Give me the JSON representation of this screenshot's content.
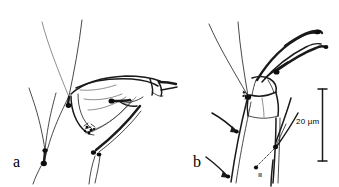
{
  "figure": {
    "type": "scientific-line-drawing",
    "background_color": "#ffffff",
    "ink_color": "#000000",
    "width": 339,
    "height": 187,
    "panels": [
      {
        "id": "a",
        "label": "a",
        "description": "Lateral view of appendage with elongate segment, long tapering setae and basal setal cluster"
      },
      {
        "id": "b",
        "label": "b",
        "description": "Lateral view of appendage with columnar segments, distal claw-like process and fine setae"
      }
    ],
    "scalebar": {
      "label": "20 µm",
      "value": 20,
      "unit": "µm",
      "orientation": "vertical"
    }
  }
}
